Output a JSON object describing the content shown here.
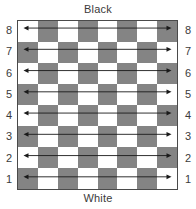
{
  "diagram": {
    "title_top": "Black",
    "title_bottom": "White",
    "board": {
      "files": 8,
      "ranks": 8,
      "rank_labels_left": [
        "8",
        "7",
        "6",
        "5",
        "4",
        "3",
        "2",
        "1"
      ],
      "rank_labels_right": [
        "8",
        "7",
        "6",
        "5",
        "4",
        "3",
        "2",
        "1"
      ],
      "light_color": "#ffffff",
      "dark_color": "#848484",
      "border_color": "#4a4a4a",
      "a8_is_light": true,
      "squares": [
        [
          "light",
          "dark",
          "light",
          "dark",
          "light",
          "dark",
          "light",
          "dark"
        ],
        [
          "dark",
          "light",
          "dark",
          "light",
          "dark",
          "light",
          "dark",
          "light"
        ],
        [
          "light",
          "dark",
          "light",
          "dark",
          "light",
          "dark",
          "light",
          "dark"
        ],
        [
          "dark",
          "light",
          "dark",
          "light",
          "dark",
          "light",
          "dark",
          "light"
        ],
        [
          "light",
          "dark",
          "light",
          "dark",
          "light",
          "dark",
          "light",
          "dark"
        ],
        [
          "dark",
          "light",
          "dark",
          "light",
          "dark",
          "light",
          "dark",
          "light"
        ],
        [
          "light",
          "dark",
          "light",
          "dark",
          "light",
          "dark",
          "light",
          "dark"
        ],
        [
          "dark",
          "light",
          "dark",
          "light",
          "dark",
          "light",
          "dark",
          "light"
        ]
      ]
    },
    "arrows": {
      "color": "#1a1a1a",
      "style": "double-headed-horizontal",
      "count": 8,
      "rows": [
        "8",
        "7",
        "6",
        "5",
        "4",
        "3",
        "2",
        "1"
      ]
    }
  }
}
